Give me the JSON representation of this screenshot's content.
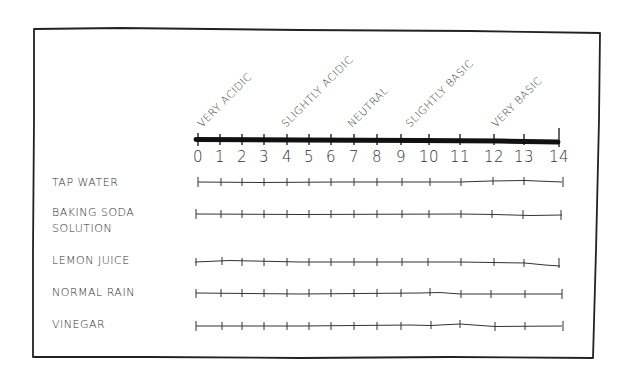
{
  "diagram": {
    "type": "ph-scale-worksheet",
    "scale": {
      "min": 0,
      "max": 14,
      "ticks": [
        "0",
        "1",
        "2",
        "3",
        "4",
        "5",
        "6",
        "7",
        "8",
        "9",
        "10",
        "11",
        "12",
        "13",
        "14"
      ],
      "regions": [
        {
          "label": "VERY ACIDIC",
          "at": 0.2
        },
        {
          "label": "SLIGHTLY ACIDIC",
          "at": 4.1
        },
        {
          "label": "NEUTRAL",
          "at": 7.0
        },
        {
          "label": "SLIGHTLY BASIC",
          "at": 9.3
        },
        {
          "label": "VERY BASIC",
          "at": 12.3
        }
      ]
    },
    "samples": [
      {
        "label_lines": [
          "TAP WATER"
        ]
      },
      {
        "label_lines": [
          "BAKING SODA",
          "SOLUTION"
        ]
      },
      {
        "label_lines": [
          "LEMON JUICE"
        ]
      },
      {
        "label_lines": [
          "NORMAL RAIN"
        ]
      },
      {
        "label_lines": [
          "VINEGAR"
        ]
      }
    ],
    "colors": {
      "ink": "#222222",
      "paper": "#ffffff"
    }
  }
}
